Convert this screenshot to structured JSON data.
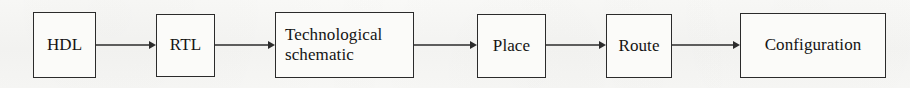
{
  "diagram": {
    "background_color": "#f7f7f5",
    "stroke_color": "#2b2b2b",
    "text_color": "#141414",
    "nodes": [
      {
        "id": "hdl",
        "label": "HDL",
        "align": "center",
        "x": 33,
        "y": 12,
        "w": 63,
        "h": 66
      },
      {
        "id": "rtl",
        "label": "RTL",
        "align": "center",
        "x": 156,
        "y": 14,
        "w": 59,
        "h": 63
      },
      {
        "id": "tech-schematic",
        "label": "Technological\nschematic",
        "align": "left",
        "x": 275,
        "y": 12,
        "w": 139,
        "h": 66
      },
      {
        "id": "place",
        "label": "Place",
        "align": "center",
        "x": 477,
        "y": 14,
        "w": 69,
        "h": 64
      },
      {
        "id": "route",
        "label": "Route",
        "align": "center",
        "x": 606,
        "y": 14,
        "w": 66,
        "h": 64
      },
      {
        "id": "configuration",
        "label": "Configuration",
        "align": "center",
        "x": 740,
        "y": 13,
        "w": 146,
        "h": 65
      }
    ],
    "edges": [
      {
        "id": "hdl-to-rtl",
        "from": "hdl",
        "to": "rtl",
        "x": 96,
        "y": 38,
        "length": 60
      },
      {
        "id": "rtl-to-tech-schematic",
        "from": "rtl",
        "to": "tech-schematic",
        "x": 215,
        "y": 38,
        "length": 60
      },
      {
        "id": "tech-schematic-to-place",
        "from": "tech-schematic",
        "to": "place",
        "x": 414,
        "y": 38,
        "length": 63
      },
      {
        "id": "place-to-route",
        "from": "place",
        "to": "route",
        "x": 546,
        "y": 38,
        "length": 60
      },
      {
        "id": "route-to-configuration",
        "from": "route",
        "to": "configuration",
        "x": 672,
        "y": 38,
        "length": 68
      }
    ]
  }
}
